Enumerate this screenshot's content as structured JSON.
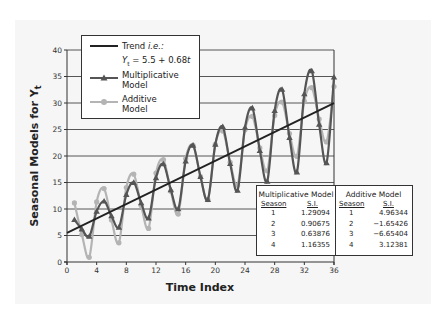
{
  "chart_data": {
    "type": "line",
    "title": "",
    "xlabel": "Time Index",
    "ylabel": "Seasonal Models for Y",
    "ylabel_subscript": "t",
    "xlim": [
      0,
      36
    ],
    "ylim": [
      0,
      40
    ],
    "xticks": [
      0,
      4,
      8,
      12,
      16,
      20,
      24,
      28,
      32,
      36
    ],
    "yticks": [
      0,
      5,
      10,
      15,
      20,
      25,
      30,
      35,
      40
    ],
    "grid": "horizontal",
    "legend_placement": "top-left",
    "trend": {
      "intercept": 5.5,
      "slope": 0.68,
      "x_range": [
        0,
        36
      ]
    },
    "x": [
      1,
      2,
      3,
      4,
      5,
      6,
      7,
      8,
      9,
      10,
      11,
      12,
      13,
      14,
      15,
      16,
      17,
      18,
      19,
      20,
      21,
      22,
      23,
      24,
      25,
      26,
      27,
      28,
      29,
      30,
      31,
      32,
      33,
      34,
      35,
      36
    ],
    "series": [
      {
        "name": "Trend",
        "color": "#222222",
        "marker": "none",
        "values": [
          6.18,
          6.86,
          7.54,
          8.22,
          8.9,
          9.58,
          10.26,
          10.94,
          11.62,
          12.3,
          12.98,
          13.66,
          14.34,
          15.02,
          15.7,
          16.38,
          17.06,
          17.74,
          18.42,
          19.1,
          19.78,
          20.46,
          21.14,
          21.82,
          22.5,
          23.18,
          23.86,
          24.54,
          25.22,
          25.9,
          26.58,
          27.26,
          27.94,
          28.62,
          29.3,
          29.98
        ]
      },
      {
        "name": "Multiplicative Model",
        "color": "#555555",
        "marker": "triangle",
        "values": [
          7.98,
          6.22,
          4.82,
          9.56,
          11.49,
          8.69,
          6.55,
          12.73,
          15.0,
          11.15,
          8.29,
          15.89,
          18.51,
          13.62,
          10.03,
          19.06,
          22.02,
          16.09,
          11.77,
          22.22,
          25.53,
          18.55,
          13.5,
          25.39,
          29.05,
          21.02,
          15.24,
          28.55,
          32.56,
          23.48,
          16.98,
          31.72,
          36.07,
          25.95,
          18.72,
          34.88
        ]
      },
      {
        "name": "Additive Model",
        "color": "#b4b4b4",
        "marker": "circle",
        "values": [
          11.14,
          5.21,
          0.89,
          11.34,
          13.86,
          7.93,
          3.61,
          14.06,
          16.58,
          10.65,
          6.33,
          16.78,
          19.3,
          13.37,
          9.05,
          19.5,
          22.02,
          16.09,
          11.77,
          22.22,
          24.74,
          18.81,
          14.49,
          24.94,
          27.46,
          21.53,
          17.21,
          27.66,
          30.18,
          24.25,
          19.93,
          30.38,
          32.9,
          26.97,
          22.65,
          33.1
        ]
      }
    ],
    "legend": [
      {
        "label": "Trend i.e.:",
        "formula": "Yₜ = 5.5 + 0.68t"
      },
      {
        "label": "Multiplicative Model"
      },
      {
        "label": "Additive Model"
      }
    ],
    "seasonal_indices": {
      "multiplicative": {
        "title": "Multiplicative Model",
        "headers": [
          "Season",
          "S.I."
        ],
        "rows": [
          [
            "1",
            "1.29094"
          ],
          [
            "2",
            "0.90675"
          ],
          [
            "3",
            "0.63876"
          ],
          [
            "4",
            "1.16355"
          ]
        ]
      },
      "additive": {
        "title": "Additive Model",
        "headers": [
          "Season",
          "S.I."
        ],
        "rows": [
          [
            "1",
            "4.96344"
          ],
          [
            "2",
            "−1.65426"
          ],
          [
            "3",
            "−6.65404"
          ],
          [
            "4",
            "3.12381"
          ]
        ]
      }
    }
  },
  "legend": {
    "trend_label_plain": "Trend ",
    "trend_label_italic": "i.e.:",
    "trend_formula_y": "Y",
    "trend_formula_sub": "t",
    "trend_formula_rest": " = 5.5 + 0.68",
    "trend_formula_t": "t",
    "mult_line1": "Multiplicative",
    "mult_line2": "Model",
    "add_line1": "Additive",
    "add_line2": "Model"
  },
  "table": {
    "mult_title": "Multiplicative Model",
    "add_title": "Additive Model",
    "season_hdr": "Season",
    "si_hdr": "S.I."
  },
  "axes": {
    "xlabel": "Time Index",
    "ylabel": "Seasonal Models for Y",
    "ylabel_sub": "t"
  }
}
